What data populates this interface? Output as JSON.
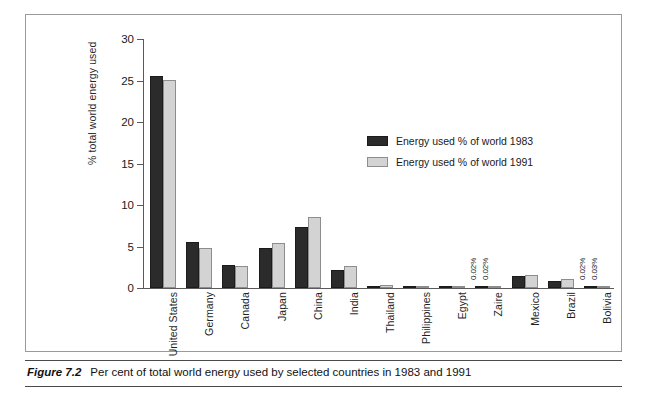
{
  "figure": {
    "number_label": "Figure 7.2",
    "caption": "Per cent of total world energy used by selected countries in 1983 and 1991"
  },
  "legend": {
    "position": "inside-top-right",
    "items": [
      {
        "label": "Energy used % of world 1983",
        "color": "#2b2b2b"
      },
      {
        "label": "Energy used % of world 1991",
        "color": "#d3d3d3"
      }
    ]
  },
  "chart_data": {
    "type": "bar",
    "title": "",
    "subtitle": "",
    "xlabel": "",
    "ylabel": "% total world energy used",
    "ylim": [
      0,
      30
    ],
    "yticks": [
      0,
      5,
      10,
      15,
      20,
      25,
      30
    ],
    "ytick_labels": [
      "0",
      "5",
      "10",
      "15",
      "20",
      "25",
      "30"
    ],
    "grid": false,
    "legend_position": "inside-top-right",
    "categories": [
      "United States",
      "Germany",
      "Canada",
      "Japan",
      "China",
      "India",
      "Thailand",
      "Philippines",
      "Egypt",
      "Zaire",
      "Mexico",
      "Brazil",
      "Bolivia"
    ],
    "series": [
      {
        "name": "Energy used % of world 1983",
        "color": "#2b2b2b",
        "values": [
          25.6,
          5.5,
          2.8,
          4.8,
          7.3,
          2.2,
          0.25,
          0.2,
          0.25,
          0.02,
          1.5,
          0.9,
          0.02
        ]
      },
      {
        "name": "Energy used % of world 1991",
        "color": "#d3d3d3",
        "values": [
          25.1,
          4.8,
          2.7,
          5.4,
          8.5,
          2.6,
          0.35,
          0.3,
          0.3,
          0.02,
          1.6,
          1.1,
          0.03
        ]
      }
    ],
    "annotations": [
      {
        "category": "Zaire",
        "series": "Energy used % of world 1983",
        "text": "0.02%"
      },
      {
        "category": "Zaire",
        "series": "Energy used % of world 1991",
        "text": "0.02%"
      },
      {
        "category": "Bolivia",
        "series": "Energy used % of world 1983",
        "text": "0.02%"
      },
      {
        "category": "Bolivia",
        "series": "Energy used % of world 1991",
        "text": "0.03%"
      }
    ]
  }
}
